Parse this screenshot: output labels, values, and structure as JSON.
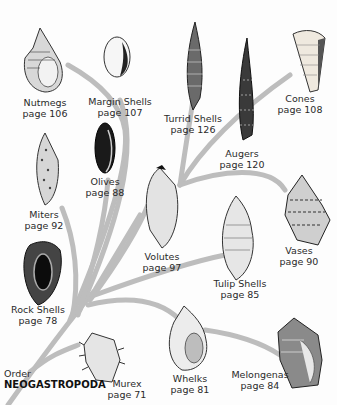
{
  "diagram": {
    "type": "taxonomy-tree",
    "branch_color": "#b9b9b9",
    "root": {
      "rank": "Order",
      "name": "NEOGASTROPODA"
    },
    "families": [
      {
        "id": "nutmegs",
        "name": "Nutmegs",
        "page": "page 106"
      },
      {
        "id": "margin-shells",
        "name": "Margin Shells",
        "page": "page 107"
      },
      {
        "id": "turrid-shells",
        "name": "Turrid Shells",
        "page": "page 126"
      },
      {
        "id": "augers",
        "name": "Augers",
        "page": "page 120"
      },
      {
        "id": "cones",
        "name": "Cones",
        "page": "page 108"
      },
      {
        "id": "olives",
        "name": "Olives",
        "page": "page 88"
      },
      {
        "id": "miters",
        "name": "Miters",
        "page": "page 92"
      },
      {
        "id": "volutes",
        "name": "Volutes",
        "page": "page 97"
      },
      {
        "id": "vases",
        "name": "Vases",
        "page": "page 90"
      },
      {
        "id": "tulip-shells",
        "name": "Tulip Shells",
        "page": "page 85"
      },
      {
        "id": "rock-shells",
        "name": "Rock Shells",
        "page": "page 78"
      },
      {
        "id": "murex",
        "name": "Murex",
        "page": "page 71"
      },
      {
        "id": "whelks",
        "name": "Whelks",
        "page": "page 81"
      },
      {
        "id": "melongenas",
        "name": "Melongenas",
        "page": "page 84"
      }
    ]
  }
}
